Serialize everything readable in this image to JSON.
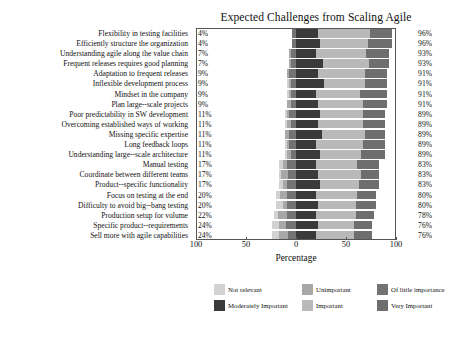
{
  "chart_data": {
    "type": "bar",
    "subtype": "diverging-stacked-likert",
    "title": "Expected Challenges from Scaling Agile",
    "xlabel": "Percentage",
    "ylabel": "",
    "xlim": [
      -100,
      100
    ],
    "xticks": [
      {
        "value": -100,
        "label": "100"
      },
      {
        "value": -50,
        "label": "50"
      },
      {
        "value": 0,
        "label": "0"
      },
      {
        "value": 50,
        "label": "50"
      },
      {
        "value": 100,
        "label": "100"
      }
    ],
    "grid": false,
    "legend_position": "bottom",
    "legend": [
      {
        "name": "Not relevant",
        "color": "#d2d2d2"
      },
      {
        "name": "Unimportant",
        "color": "#a8a8a8"
      },
      {
        "name": "Of little importance",
        "color": "#737373"
      },
      {
        "name": "Moderately Important",
        "color": "#3a3a3a"
      },
      {
        "name": "Important",
        "color": "#b9b9b9"
      },
      {
        "name": "Very Important",
        "color": "#6e6e6e"
      }
    ],
    "series": [
      {
        "name": "Not relevant",
        "color": "#d2d2d2"
      },
      {
        "name": "Unimportant",
        "color": "#a8a8a8"
      },
      {
        "name": "Of little importance",
        "color": "#737373"
      },
      {
        "name": "Moderately Important",
        "color": "#3a3a3a"
      },
      {
        "name": "Important",
        "color": "#b9b9b9"
      },
      {
        "name": "Very Important",
        "color": "#6e6e6e"
      }
    ],
    "left_value_label": "negative percentage",
    "right_value_label": "positive percentage",
    "categories": [
      {
        "label": "Flexibility in testing facilities",
        "left_pct": "4%",
        "right_pct": "96%",
        "values": {
          "Not relevant": 0,
          "Unimportant": 0,
          "Of little importance": 4,
          "Moderately Important": 22,
          "Important": 52,
          "Very Important": 22
        }
      },
      {
        "label": "Efficiently structure the organization",
        "left_pct": "4%",
        "right_pct": "96%",
        "values": {
          "Not relevant": 0,
          "Unimportant": 0,
          "Of little importance": 4,
          "Moderately Important": 24,
          "Important": 48,
          "Very Important": 24
        }
      },
      {
        "label": "Understanding agile along the value chain",
        "left_pct": "7%",
        "right_pct": "93%",
        "values": {
          "Not relevant": 0,
          "Unimportant": 2,
          "Of little importance": 5,
          "Moderately Important": 20,
          "Important": 50,
          "Very Important": 23
        }
      },
      {
        "label": "Frequent releases requires good planning",
        "left_pct": "7%",
        "right_pct": "93%",
        "values": {
          "Not relevant": 0,
          "Unimportant": 2,
          "Of little importance": 5,
          "Moderately Important": 27,
          "Important": 46,
          "Very Important": 20
        }
      },
      {
        "label": "Adaptation to frequent releases",
        "left_pct": "9%",
        "right_pct": "91%",
        "values": {
          "Not relevant": 0,
          "Unimportant": 2,
          "Of little importance": 7,
          "Moderately Important": 22,
          "Important": 47,
          "Very Important": 22
        }
      },
      {
        "label": "Inflexible development process",
        "left_pct": "9%",
        "right_pct": "91%",
        "values": {
          "Not relevant": 2,
          "Unimportant": 2,
          "Of little importance": 5,
          "Moderately Important": 28,
          "Important": 41,
          "Very Important": 22
        }
      },
      {
        "label": "Mindset in the company",
        "left_pct": "9%",
        "right_pct": "91%",
        "values": {
          "Not relevant": 2,
          "Unimportant": 2,
          "Of little importance": 5,
          "Moderately Important": 20,
          "Important": 44,
          "Very Important": 27
        }
      },
      {
        "label": "Plan large--scale projects",
        "left_pct": "9%",
        "right_pct": "91%",
        "values": {
          "Not relevant": 0,
          "Unimportant": 4,
          "Of little importance": 5,
          "Moderately Important": 22,
          "Important": 45,
          "Very Important": 24
        }
      },
      {
        "label": "Poor predictability in SW development",
        "left_pct": "11%",
        "right_pct": "89%",
        "values": {
          "Not relevant": 2,
          "Unimportant": 2,
          "Of little importance": 7,
          "Moderately Important": 24,
          "Important": 43,
          "Very Important": 22
        }
      },
      {
        "label": "Overcoming established ways of working",
        "left_pct": "11%",
        "right_pct": "89%",
        "values": {
          "Not relevant": 2,
          "Unimportant": 4,
          "Of little importance": 5,
          "Moderately Important": 22,
          "Important": 45,
          "Very Important": 22
        }
      },
      {
        "label": "Missing specific expertise",
        "left_pct": "11%",
        "right_pct": "89%",
        "values": {
          "Not relevant": 0,
          "Unimportant": 4,
          "Of little importance": 7,
          "Moderately Important": 26,
          "Important": 43,
          "Very Important": 20
        }
      },
      {
        "label": "Long feedback loops",
        "left_pct": "11%",
        "right_pct": "89%",
        "values": {
          "Not relevant": 2,
          "Unimportant": 2,
          "Of little importance": 7,
          "Moderately Important": 20,
          "Important": 47,
          "Very Important": 22
        }
      },
      {
        "label": "Understanding large--scale architecture",
        "left_pct": "11%",
        "right_pct": "89%",
        "values": {
          "Not relevant": 2,
          "Unimportant": 4,
          "Of little importance": 5,
          "Moderately Important": 24,
          "Important": 41,
          "Very Important": 24
        }
      },
      {
        "label": "Manual testing",
        "left_pct": "17%",
        "right_pct": "83%",
        "values": {
          "Not relevant": 4,
          "Unimportant": 4,
          "Of little importance": 9,
          "Moderately Important": 20,
          "Important": 41,
          "Very Important": 22
        }
      },
      {
        "label": "Coordinate between different teams",
        "left_pct": "17%",
        "right_pct": "83%",
        "values": {
          "Not relevant": 2,
          "Unimportant": 7,
          "Of little importance": 8,
          "Moderately Important": 22,
          "Important": 43,
          "Very Important": 18
        }
      },
      {
        "label": "Product--specific functionality",
        "left_pct": "17%",
        "right_pct": "83%",
        "values": {
          "Not relevant": 4,
          "Unimportant": 4,
          "Of little importance": 9,
          "Moderately Important": 24,
          "Important": 39,
          "Very Important": 20
        }
      },
      {
        "label": "Focus on testing at the end",
        "left_pct": "20%",
        "right_pct": "80%",
        "values": {
          "Not relevant": 4,
          "Unimportant": 7,
          "Of little importance": 9,
          "Moderately Important": 20,
          "Important": 41,
          "Very Important": 19
        }
      },
      {
        "label": "Difficulty to avoid big--bang testing",
        "left_pct": "20%",
        "right_pct": "80%",
        "values": {
          "Not relevant": 7,
          "Unimportant": 4,
          "Of little importance": 9,
          "Moderately Important": 22,
          "Important": 38,
          "Very Important": 20
        }
      },
      {
        "label": "Production setup for volume",
        "left_pct": "22%",
        "right_pct": "78%",
        "values": {
          "Not relevant": 4,
          "Unimportant": 9,
          "Of little importance": 9,
          "Moderately Important": 20,
          "Important": 40,
          "Very Important": 18
        }
      },
      {
        "label": "Specific product--requirements",
        "left_pct": "24%",
        "right_pct": "76%",
        "values": {
          "Not relevant": 7,
          "Unimportant": 7,
          "Of little importance": 10,
          "Moderately Important": 22,
          "Important": 36,
          "Very Important": 18
        }
      },
      {
        "label": "Sell more with agile capabilities",
        "left_pct": "24%",
        "right_pct": "76%",
        "values": {
          "Not relevant": 7,
          "Unimportant": 9,
          "Of little importance": 8,
          "Moderately Important": 20,
          "Important": 38,
          "Very Important": 18
        }
      }
    ]
  }
}
